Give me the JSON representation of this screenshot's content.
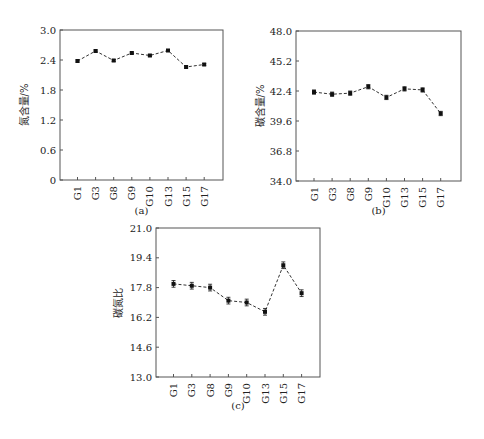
{
  "chart_data": [
    {
      "id": "a",
      "type": "line",
      "caption": "(a)",
      "title": "",
      "xlabel": "",
      "ylabel": "氮含量/%",
      "categories": [
        "G1",
        "G3",
        "G8",
        "G9",
        "G10",
        "G13",
        "G15",
        "G17"
      ],
      "values": [
        2.38,
        2.58,
        2.39,
        2.54,
        2.49,
        2.59,
        2.26,
        2.31
      ],
      "error": [
        0.02,
        0.02,
        0.02,
        0.02,
        0.02,
        0.02,
        0.02,
        0.02
      ],
      "ylim": [
        0,
        3.0
      ],
      "yticks": [
        "0",
        "0.6",
        "1.2",
        "1.8",
        "2.4",
        "3.0"
      ],
      "grid": false,
      "line_style": "dashed",
      "marker": "square"
    },
    {
      "id": "b",
      "type": "line",
      "caption": "(b)",
      "title": "",
      "xlabel": "",
      "ylabel": "碳含量/%",
      "categories": [
        "G1",
        "G3",
        "G8",
        "G9",
        "G10",
        "G13",
        "G15",
        "G17"
      ],
      "values": [
        42.3,
        42.1,
        42.2,
        42.8,
        41.8,
        42.6,
        42.5,
        40.3
      ],
      "error": [
        0.2,
        0.2,
        0.2,
        0.2,
        0.2,
        0.2,
        0.2,
        0.2
      ],
      "ylim": [
        34.0,
        48.0
      ],
      "yticks": [
        "34.0",
        "36.8",
        "39.6",
        "42.4",
        "45.2",
        "48.0"
      ],
      "grid": false,
      "line_style": "dashed",
      "marker": "square"
    },
    {
      "id": "c",
      "type": "line",
      "caption": "(c)",
      "title": "",
      "xlabel": "",
      "ylabel": "碳氮比",
      "categories": [
        "G1",
        "G3",
        "G8",
        "G9",
        "G10",
        "G13",
        "G15",
        "G17"
      ],
      "values": [
        18.0,
        17.9,
        17.8,
        17.1,
        17.0,
        16.5,
        19.0,
        17.5
      ],
      "error": [
        0.18,
        0.18,
        0.18,
        0.18,
        0.18,
        0.18,
        0.18,
        0.18
      ],
      "ylim": [
        13.0,
        21.0
      ],
      "yticks": [
        "13.0",
        "14.6",
        "16.2",
        "17.8",
        "19.4",
        "21.0"
      ],
      "grid": false,
      "line_style": "dashed",
      "marker": "square"
    }
  ],
  "layout": [
    {
      "x0": 60,
      "x1": 223,
      "y0": 30,
      "y1": 180,
      "first_tick": 77.5,
      "tick_step": 18.1,
      "caption_y": 214,
      "ylabel_x": 28
    },
    {
      "x0": 296,
      "x1": 461,
      "y0": 31,
      "y1": 181,
      "first_tick": 314,
      "tick_step": 18.1,
      "caption_y": 214,
      "ylabel_x": 264
    },
    {
      "x0": 156,
      "x1": 320,
      "y0": 228,
      "y1": 377,
      "first_tick": 173.5,
      "tick_step": 18.3,
      "caption_y": 409,
      "ylabel_x": 122
    }
  ],
  "colors": {
    "line": "#333333",
    "axis": "#555555",
    "marker": "#111111"
  }
}
